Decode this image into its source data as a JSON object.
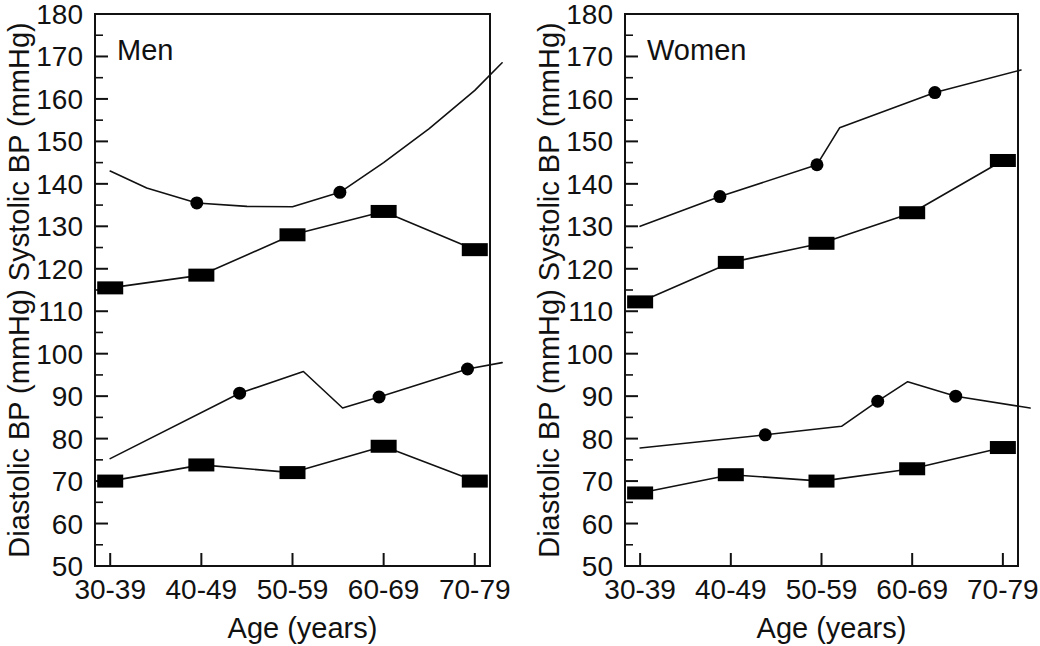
{
  "figure": {
    "background": "#ffffff",
    "ink_color": "#111111",
    "marker_color": "#000000"
  },
  "axis": {
    "x_title": "Age (years)",
    "y_title_upper": "Systolic BP (mmHg)",
    "y_title_lower": "Diastolic BP (mmHg)",
    "y_title_combined": "Diastolic BP (mmHg) Systolic BP (mmHg)",
    "y_ticks": [
      50,
      60,
      70,
      80,
      90,
      100,
      110,
      120,
      130,
      140,
      150,
      160,
      170,
      180
    ],
    "y_tick_labels": [
      "50",
      "60",
      "70",
      "80",
      "90",
      "100",
      "110",
      "120",
      "130",
      "140",
      "150",
      "160",
      "170",
      "180"
    ],
    "y_min": 50,
    "y_max": 180,
    "y_minor_step": 5,
    "x_tick_labels": [
      "30-39",
      "40-49",
      "50-59",
      "60-69",
      "70-79"
    ],
    "grid": false,
    "legend": false
  },
  "chart_data": [
    {
      "type": "line",
      "title": "Men",
      "xlabel": "Age (years)",
      "ylabel": "Diastolic BP (mmHg) Systolic BP (mmHg)",
      "categories": [
        "30-39",
        "40-49",
        "50-59",
        "60-69",
        "70-79"
      ],
      "ylim": [
        50,
        180
      ],
      "series": [
        {
          "name": "Men systolic - square series",
          "marker": "square",
          "values": [
            115.5,
            118.5,
            128.0,
            133.5,
            124.5
          ],
          "x_positions": [
            0,
            1,
            2,
            3,
            4
          ]
        },
        {
          "name": "Men systolic - circle series",
          "marker": "circle",
          "values": [
            135.5,
            138.0
          ],
          "x_positions": [
            0.95,
            2.52
          ],
          "curve_points": [
            [
              0.0,
              143.0
            ],
            [
              0.4,
              139.0
            ],
            [
              0.95,
              135.5
            ],
            [
              1.5,
              134.7
            ],
            [
              2.0,
              134.6
            ],
            [
              2.52,
              138.0
            ],
            [
              3.0,
              145.0
            ],
            [
              3.5,
              153.0
            ],
            [
              4.0,
              162.0
            ],
            [
              4.3,
              168.5
            ]
          ]
        },
        {
          "name": "Men diastolic - square series",
          "marker": "square",
          "values": [
            70.0,
            73.8,
            72.0,
            78.2,
            70.0
          ],
          "x_positions": [
            0,
            1,
            2,
            3,
            4
          ]
        },
        {
          "name": "Men diastolic - circle series",
          "marker": "circle",
          "values": [
            90.7,
            89.8,
            96.4
          ],
          "x_positions": [
            1.42,
            2.95,
            3.92
          ],
          "curve_points": [
            [
              0.0,
              75.3
            ],
            [
              1.42,
              90.7
            ],
            [
              2.12,
              95.8
            ],
            [
              2.55,
              87.2
            ],
            [
              2.95,
              89.8
            ],
            [
              3.92,
              96.4
            ],
            [
              4.3,
              97.9
            ]
          ]
        }
      ]
    },
    {
      "type": "line",
      "title": "Women",
      "xlabel": "Age (years)",
      "ylabel": "Diastolic BP (mmHg) Systolic BP (mmHg)",
      "categories": [
        "30-39",
        "40-49",
        "50-59",
        "60-69",
        "70-79"
      ],
      "ylim": [
        50,
        180
      ],
      "series": [
        {
          "name": "Women systolic - square series",
          "marker": "square",
          "values": [
            112.2,
            121.5,
            126.0,
            133.2,
            145.5
          ],
          "x_positions": [
            0,
            1,
            2,
            3,
            4
          ]
        },
        {
          "name": "Women systolic - circle series",
          "marker": "circle",
          "values": [
            137.0,
            144.5,
            161.5
          ],
          "x_positions": [
            0.88,
            1.95,
            3.25
          ],
          "curve_points": [
            [
              0.0,
              130.0
            ],
            [
              0.88,
              137.0
            ],
            [
              1.95,
              144.5
            ],
            [
              2.2,
              153.2
            ],
            [
              3.25,
              161.5
            ],
            [
              4.2,
              166.8
            ]
          ]
        },
        {
          "name": "Women diastolic - square series",
          "marker": "square",
          "values": [
            67.2,
            71.5,
            70.0,
            72.9,
            77.9
          ],
          "x_positions": [
            0,
            1,
            2,
            3,
            4
          ]
        },
        {
          "name": "Women diastolic - circle series",
          "marker": "circle",
          "values": [
            80.9,
            88.8,
            90.0
          ],
          "x_positions": [
            1.38,
            2.62,
            3.48
          ],
          "curve_points": [
            [
              0.0,
              77.8
            ],
            [
              1.38,
              80.9
            ],
            [
              2.22,
              82.9
            ],
            [
              2.62,
              88.8
            ],
            [
              2.95,
              93.4
            ],
            [
              3.48,
              90.0
            ],
            [
              4.3,
              87.2
            ]
          ]
        }
      ]
    }
  ]
}
